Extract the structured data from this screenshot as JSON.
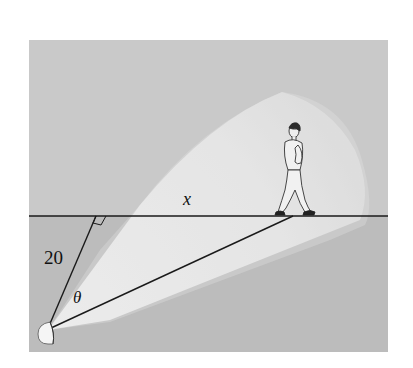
{
  "diagram": {
    "type": "geometry-illustration",
    "labels": {
      "distance": "20",
      "path_distance": "x",
      "angle": "θ"
    },
    "colors": {
      "background_panel": "#c9c9c9",
      "lower_region": "#bdbdbd",
      "light_beam": "#e6e6e6",
      "beam_core": "#f0f0f0",
      "lines": "#1a1a1a"
    },
    "elements": [
      "horizontal-path-line",
      "perpendicular-segment",
      "right-angle-marker",
      "hypotenuse-line",
      "searchlight",
      "light-beam",
      "walking-person"
    ]
  }
}
